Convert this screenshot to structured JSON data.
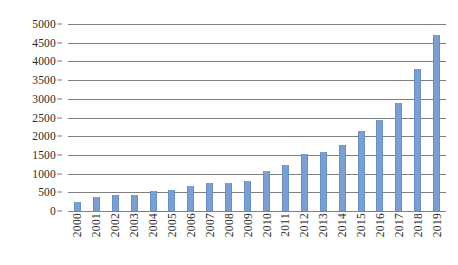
{
  "chart_data": {
    "type": "bar",
    "title": "",
    "subtitle": "",
    "xlabel": "",
    "ylabel": "",
    "legend": [],
    "grid": true,
    "legend_position": "none",
    "ylim": [
      0,
      5000
    ],
    "ytick_step": 500,
    "yticks": [
      "0",
      "500",
      "1000",
      "1500",
      "2000",
      "2500",
      "3000",
      "3500",
      "4000",
      "4500",
      "5000"
    ],
    "ytick_values": [
      0,
      500,
      1000,
      1500,
      2000,
      2500,
      3000,
      3500,
      4000,
      4500,
      5000
    ],
    "categories": [
      "2000",
      "2001",
      "2002",
      "2003",
      "2004",
      "2005",
      "2006",
      "2007",
      "2008",
      "2009",
      "2010",
      "2011",
      "2012",
      "2013",
      "2014",
      "2015",
      "2016",
      "2017",
      "2018",
      "2019"
    ],
    "values": [
      250,
      370,
      420,
      430,
      540,
      560,
      680,
      740,
      760,
      800,
      1080,
      1220,
      1520,
      1570,
      1760,
      2130,
      2440,
      2900,
      3800,
      4700
    ],
    "bar_color": "#7b9fd1",
    "gridline_color": "#808080",
    "background_color": "#ffffff"
  }
}
